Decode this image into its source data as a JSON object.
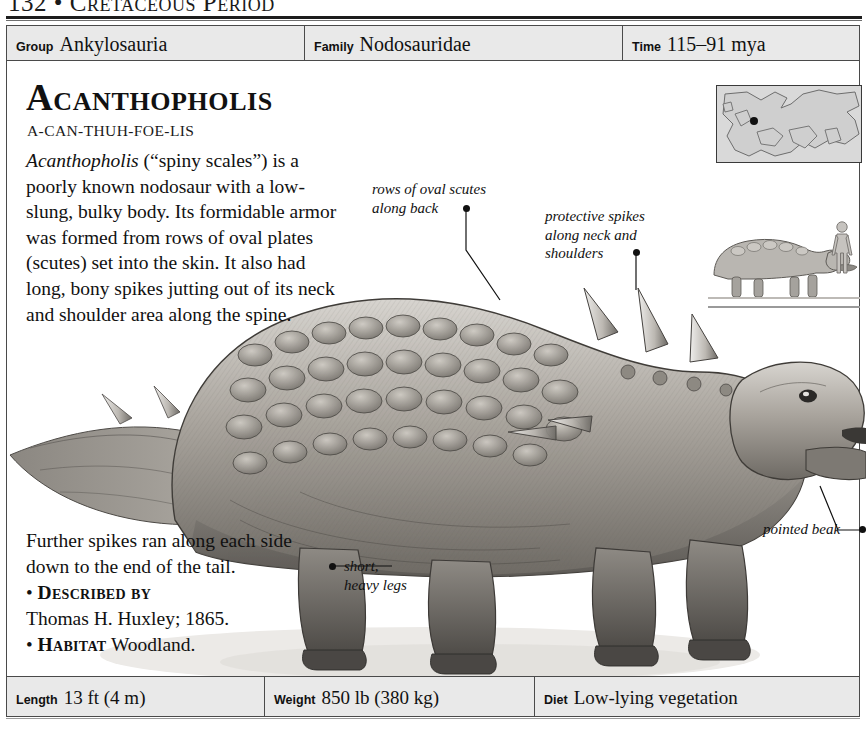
{
  "running_head": {
    "page_number": "132",
    "separator": "•",
    "title": "Cretaceous Period",
    "full": "132 • Cretaceous Period"
  },
  "info_bar": [
    {
      "label": "Group",
      "value": "Ankylosauria"
    },
    {
      "label": "Family",
      "value": "Nodosauridae"
    },
    {
      "label": "Time",
      "value": "115–91 mya"
    }
  ],
  "entry": {
    "name": "Acantholis_placeholder",
    "title": "Acantholis",
    "title_display": "Acantholis",
    "heading": "Acanthopholis",
    "pronunciation": "A-CAN-THUH-FOE-LIS",
    "genus_italic": "Acanthopholis",
    "description_rest": " (“spiny scales”) is a poorly known nodosaur with a low-slung, bulky body. Its formidable armor was formed from rows of oval plates (scutes) set into the skin. It also had long, bony spikes jutting out of its neck and shoulder area along the spine.",
    "lower_text": "Further spikes ran along each side down to the end of the tail.",
    "described_by_label": "Described by",
    "described_by_value": "Thomas H. Huxley; 1865.",
    "habitat_label": "Habitat",
    "habitat_value": "Woodland.",
    "bullet_glyph": "•"
  },
  "annotations": [
    {
      "id": "scutes",
      "line1": "rows of oval scutes",
      "line2": "along back"
    },
    {
      "id": "spikes",
      "line1": "protective spikes",
      "line2": "along neck and",
      "line3": "shoulders"
    },
    {
      "id": "legs",
      "line1": "short,",
      "line2": "heavy legs"
    },
    {
      "id": "beak",
      "line1": "pointed beak"
    }
  ],
  "insets": {
    "map_caption": "",
    "map_region": "Europe",
    "scale_caption": ""
  },
  "stat_bar": [
    {
      "label": "Length",
      "value": "13 ft (4 m)"
    },
    {
      "label": "Weight",
      "value": "850 lb (380 kg)"
    },
    {
      "label": "Diet",
      "value": "Low-lying vegetation"
    }
  ],
  "colors": {
    "rule": "#1d1d1d",
    "bar_bg": "#e9e9e9",
    "bar_border": "#4a4a4a",
    "text": "#111111"
  }
}
